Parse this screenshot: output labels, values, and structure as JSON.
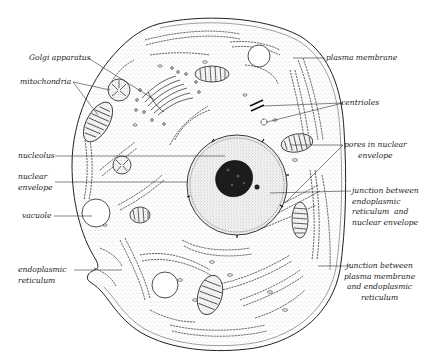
{
  "diagram": {
    "title": "",
    "colors": {
      "ink": "#1a1a1a",
      "stipple": "#555555",
      "background": "#ffffff"
    },
    "labels": {
      "golgi": "Golgi apparatus",
      "mitochondria": "mitochondria",
      "nucleolus": "nucleolus",
      "nuclear_envelope": "nuclear\nenvelope",
      "vacuole": "vacuole",
      "er": "endoplasmic\nreticulum",
      "plasma_membrane": "plasma membrane",
      "centrioles": "centrioles",
      "pores": "pores in nuclear\nenvelope",
      "junction_er_nuclear": "junction between\nendoplasmic\nreticulum  and\nnuclear envelope",
      "junction_pm_er": "junction between\nplasma membrane\nand endoplasmic\nreticulum"
    }
  }
}
